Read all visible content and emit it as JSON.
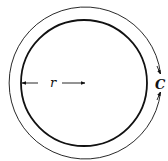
{
  "diagram": {
    "labels": {
      "radius": "r",
      "circumference": "C"
    },
    "colors": {
      "stroke": "#111111",
      "background": "#ffffff"
    },
    "geometry": {
      "center": [
        84,
        83
      ],
      "inner_radius": 63,
      "outer_radius": 76
    }
  }
}
